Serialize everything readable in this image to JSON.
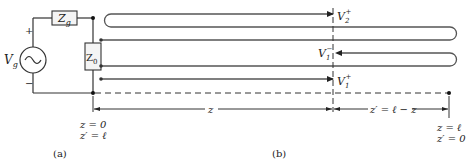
{
  "circuit": {
    "source_label": "V",
    "source_sub": "g",
    "plus": "+",
    "minus": "−",
    "gen_impedance_label": "Z",
    "gen_impedance_sub": "g",
    "load_impedance_label": "Z",
    "load_impedance_sub": "0"
  },
  "waves": {
    "v2_plus": {
      "main": "V",
      "sub": "2",
      "sup": "+"
    },
    "v1_minus": {
      "main": "V",
      "sub": "1",
      "sup": "−"
    },
    "v1_plus": {
      "main": "V",
      "sub": "1",
      "sup": "+"
    }
  },
  "dimensions": {
    "z_label": "z",
    "zprime_label": "z′ = ℓ − z",
    "left_end_line1": "z = 0",
    "left_end_line2": "z′ = ℓ",
    "right_end_line1": "z = ℓ",
    "right_end_line2": "z′ = 0"
  },
  "captions": {
    "a": "(a)",
    "b": "(b)"
  },
  "colors": {
    "line": "#333333",
    "loop": "#555555",
    "box_fill": "#f4f4f4"
  }
}
